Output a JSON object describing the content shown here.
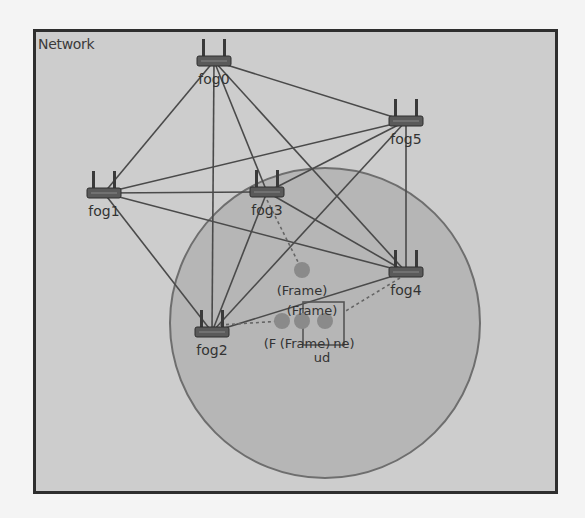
{
  "panel": {
    "title": "Network"
  },
  "colors": {
    "background": "#f4f4f4",
    "panel_fill": "#cdcdcd",
    "panel_border": "#2e2e2e",
    "range_circle_fill": "#b6b6b6",
    "range_circle_stroke": "#6e6e6e",
    "link": "#4a4a4a",
    "router_body": "#5a5a5a",
    "mobile_node": "#8a8a8a",
    "label": "#333333"
  },
  "range_circle": {
    "cx": 325,
    "cy": 323,
    "r": 155
  },
  "routers": [
    {
      "id": "fog0",
      "label": "fog0",
      "x": 214,
      "y": 61
    },
    {
      "id": "fog1",
      "label": "fog1",
      "x": 104,
      "y": 193
    },
    {
      "id": "fog2",
      "label": "fog2",
      "x": 212,
      "y": 332
    },
    {
      "id": "fog3",
      "label": "fog3",
      "x": 267,
      "y": 192
    },
    {
      "id": "fog4",
      "label": "fog4",
      "x": 406,
      "y": 272
    },
    {
      "id": "fog5",
      "label": "fog5",
      "x": 406,
      "y": 121
    }
  ],
  "links": [
    [
      "fog0",
      "fog1"
    ],
    [
      "fog0",
      "fog2"
    ],
    [
      "fog0",
      "fog3"
    ],
    [
      "fog0",
      "fog4"
    ],
    [
      "fog0",
      "fog5"
    ],
    [
      "fog1",
      "fog2"
    ],
    [
      "fog1",
      "fog3"
    ],
    [
      "fog1",
      "fog4"
    ],
    [
      "fog1",
      "fog5"
    ],
    [
      "fog5",
      "fog2"
    ],
    [
      "fog5",
      "fog3"
    ],
    [
      "fog5",
      "fog4"
    ],
    [
      "fog3",
      "fog2"
    ],
    [
      "fog3",
      "fog4"
    ],
    [
      "fog2",
      "fog4"
    ]
  ],
  "mobile_nodes": [
    {
      "id": "frame-a",
      "label": "(Frame)",
      "x": 302,
      "y": 270,
      "label_x": 302,
      "label_y": 295
    },
    {
      "id": "frame-b",
      "label": "(Frame)",
      "x": 302,
      "y": 321,
      "label_x": 312,
      "label_y": 315
    },
    {
      "id": "frame-c",
      "label": "(F",
      "x": 282,
      "y": 321,
      "label_x": 270,
      "label_y": 348
    },
    {
      "id": "frame-d",
      "label": "(Frame)",
      "x": 325,
      "y": 321,
      "label_x": 305,
      "label_y": 348
    },
    {
      "id": "frame-e",
      "label": "ne)",
      "x": 325,
      "y": 321,
      "label_x": 344,
      "label_y": 348
    }
  ],
  "ud_box": {
    "x": 303,
    "y": 302,
    "w": 41,
    "h": 43,
    "label": "ud",
    "label_x": 322,
    "label_y": 362
  },
  "dashed_links": [
    {
      "from": [
        267,
        200
      ],
      "to": [
        302,
        270
      ]
    },
    {
      "from": [
        220,
        325
      ],
      "to": [
        282,
        321
      ]
    },
    {
      "from": [
        400,
        278
      ],
      "to": [
        344,
        312
      ]
    }
  ]
}
